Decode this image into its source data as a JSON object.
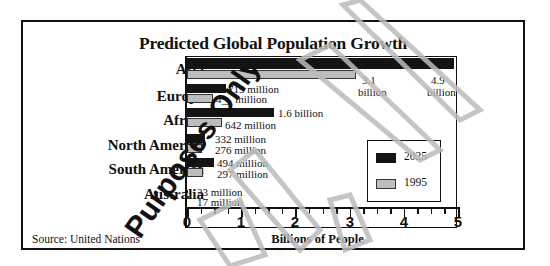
{
  "chart_data": {
    "type": "bar",
    "orientation": "horizontal",
    "title": "Predicted Global Population Growth",
    "xlabel": "Billions of People",
    "ylabel": "",
    "xlim": [
      0,
      5
    ],
    "xticks": [
      "0",
      "1",
      "2",
      "3",
      "4",
      "5"
    ],
    "categories": [
      "Asia",
      "Europe",
      "Africa",
      "North America",
      "South America",
      "Australia"
    ],
    "series": [
      {
        "name": "2025",
        "color": "#141414",
        "values": [
          4.9,
          0.715,
          1.6,
          0.332,
          0.494,
          0.023
        ],
        "labels": [
          "4.9 billion",
          "715 million",
          "1.6 billion",
          "332 million",
          "494 million",
          "23 million"
        ]
      },
      {
        "name": "1995",
        "color": "#bdbdbd",
        "values": [
          3.1,
          0.48,
          0.642,
          0.276,
          0.297,
          0.017
        ],
        "labels": [
          "3.1 billion",
          "4__ million",
          "642 million",
          "276 million",
          "297 million",
          "17 million"
        ]
      }
    ],
    "legend": {
      "position": "lower right inside plot",
      "entries": [
        "2025",
        "1995"
      ]
    },
    "grid": false,
    "source": "Source:  United Nations"
  },
  "ui": {
    "title": "Predicted Global Population Growth",
    "xlabel": "Billions of People",
    "source": "Source:  United Nations",
    "categories": [
      "Asia",
      "Europe",
      "Africa",
      "North America",
      "South America",
      "Australia"
    ],
    "labels": {
      "asia_1995_a": "3.1",
      "asia_1995_b": "billion",
      "asia_2025_a": "4.9",
      "asia_2025_b": "billion",
      "europe_2025": "715 million",
      "europe_1995": "4__ million",
      "africa_2025": "1.6 billion",
      "africa_1995": "642 million",
      "na_2025": "332 million",
      "na_1995": "276 million",
      "sa_2025": "494 million",
      "sa_1995": "297 million",
      "aus_2025": "23 million",
      "aus_1995": "17 million"
    },
    "ticks": [
      "0",
      "1",
      "2",
      "3",
      "4",
      "5"
    ],
    "legend": [
      "2025",
      "1995"
    ],
    "watermark": "Sample Purposes Only"
  }
}
